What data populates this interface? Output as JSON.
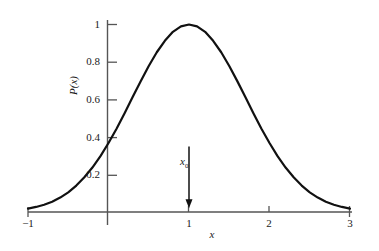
{
  "figure": {
    "background_color": "#ffffff",
    "curve_color": "#111111",
    "axis_color": "#555555",
    "text_color": "#1a1a1a"
  },
  "axes": {
    "x_title": "x",
    "y_title": "P(x)",
    "x_ticks": [
      {
        "value": -1,
        "label": "−1"
      },
      {
        "value": 0,
        "label": ""
      },
      {
        "value": 1,
        "label": "1"
      },
      {
        "value": 2,
        "label": "2"
      },
      {
        "value": 3,
        "label": "3"
      }
    ],
    "y_ticks": [
      {
        "value": 0.2,
        "label": "0.2"
      },
      {
        "value": 0.4,
        "label": "0.4"
      },
      {
        "value": 0.6,
        "label": "0.6"
      },
      {
        "value": 0.8,
        "label": "0.8"
      },
      {
        "value": 1.0,
        "label": "1"
      }
    ]
  },
  "annotation": {
    "label_main": "x",
    "label_sub": "0",
    "x_value": 1,
    "arrow_top_value": 0.35,
    "arrow_bottom_value": 0.02
  },
  "chart_data": {
    "type": "line",
    "title": "",
    "subtitle": "",
    "xlabel": "x",
    "ylabel": "P(x)",
    "xlim": [
      -1,
      3
    ],
    "ylim": [
      0,
      1.05
    ],
    "grid": false,
    "legend": "none",
    "xticks": [
      -1,
      0,
      1,
      2,
      3
    ],
    "xticklabels": [
      "−1",
      "",
      "1",
      "2",
      "3"
    ],
    "yticks": [
      0.2,
      0.4,
      0.6,
      0.8,
      1
    ],
    "yticklabels": [
      "0.2",
      "0.4",
      "0.6",
      "0.8",
      "1"
    ],
    "annotations": [
      {
        "text": "x₀",
        "x": 1,
        "y": 0.35,
        "type": "down-arrow",
        "points_to_y": 0.0
      }
    ],
    "series": [
      {
        "name": "P(x)",
        "description": "Gaussian peaked at x0 = 1 with peak value 1",
        "formula": "P(x) = exp(-(x-1)^2)",
        "peak_x": 1,
        "peak_y": 1,
        "x": [
          -1.0,
          -0.9,
          -0.8,
          -0.7,
          -0.6,
          -0.5,
          -0.4,
          -0.3,
          -0.2,
          -0.1,
          0.0,
          0.1,
          0.2,
          0.3,
          0.4,
          0.5,
          0.6,
          0.7,
          0.8,
          0.9,
          1.0,
          1.1,
          1.2,
          1.3,
          1.4,
          1.5,
          1.6,
          1.7,
          1.8,
          1.9,
          2.0,
          2.1,
          2.2,
          2.3,
          2.4,
          2.5,
          2.6,
          2.7,
          2.8,
          2.9,
          3.0
        ],
        "values": [
          0.018,
          0.027,
          0.039,
          0.055,
          0.077,
          0.105,
          0.141,
          0.185,
          0.237,
          0.298,
          0.368,
          0.444,
          0.527,
          0.613,
          0.698,
          0.779,
          0.852,
          0.913,
          0.961,
          0.99,
          1.0,
          0.99,
          0.961,
          0.913,
          0.852,
          0.779,
          0.698,
          0.613,
          0.527,
          0.444,
          0.368,
          0.298,
          0.237,
          0.185,
          0.141,
          0.105,
          0.077,
          0.055,
          0.039,
          0.027,
          0.018
        ]
      }
    ]
  }
}
